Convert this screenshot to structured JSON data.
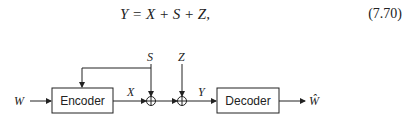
{
  "equation": {
    "text": "Y = X + S + Z,",
    "number": "(7.70)"
  },
  "diagram": {
    "blocks": [
      {
        "id": "encoder",
        "label": "Encoder"
      },
      {
        "id": "decoder",
        "label": "Decoder"
      }
    ],
    "signals": {
      "input": "W",
      "encoder_out": "X",
      "state": "S",
      "noise": "Z",
      "channel_out": "Y",
      "estimate": "Ŵ"
    },
    "junctions": [
      {
        "id": "sum1",
        "symbol": "⊕"
      },
      {
        "id": "sum2",
        "symbol": "⊕"
      }
    ]
  }
}
